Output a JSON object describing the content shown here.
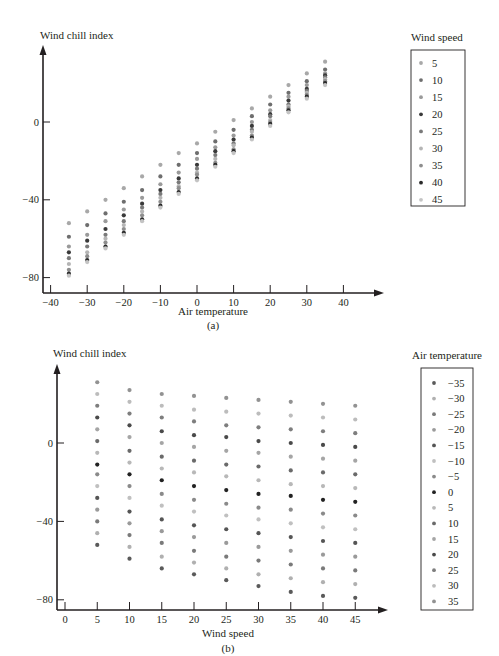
{
  "chart_data": [
    {
      "id": "a",
      "type": "scatter",
      "caption": "(a)",
      "title": "",
      "xlabel": "Air temperature",
      "ylabel": "Wind chill index",
      "xlim": [
        -40,
        40
      ],
      "ylim": [
        -80,
        35
      ],
      "xticks": [
        -40,
        -30,
        -20,
        -10,
        0,
        10,
        20,
        30,
        40
      ],
      "xtick_labels": [
        "−40",
        "−30",
        "−20",
        "−10",
        "0",
        "10",
        "20",
        "30",
        "40"
      ],
      "yticks": [
        0,
        -40,
        -80
      ],
      "ytick_labels": [
        "0",
        "−40",
        "−80"
      ],
      "grid": false,
      "legend_title": "Wind speed",
      "legend_position": "right",
      "x": [
        -35,
        -30,
        -25,
        -20,
        -15,
        -10,
        -5,
        0,
        5,
        10,
        15,
        20,
        25,
        30,
        35
      ],
      "series": [
        {
          "name": "5",
          "color": "#a8a8a8",
          "values": [
            -52,
            -46,
            -40,
            -34,
            -28,
            -22,
            -16,
            -11,
            -5,
            1,
            7,
            13,
            19,
            25,
            31
          ]
        },
        {
          "name": "10",
          "color": "#6e6e6e",
          "values": [
            -59,
            -53,
            -47,
            -41,
            -35,
            -28,
            -22,
            -16,
            -10,
            -4,
            3,
            9,
            15,
            21,
            27
          ]
        },
        {
          "name": "15",
          "color": "#9a9a9a",
          "values": [
            -64,
            -58,
            -51,
            -45,
            -39,
            -32,
            -26,
            -19,
            -13,
            -7,
            0,
            6,
            13,
            19,
            25
          ]
        },
        {
          "name": "20",
          "color": "#3a3a3a",
          "values": [
            -67,
            -61,
            -55,
            -48,
            -42,
            -35,
            -29,
            -22,
            -15,
            -9,
            -2,
            4,
            11,
            17,
            24
          ]
        },
        {
          "name": "25",
          "color": "#7a7a7a",
          "values": [
            -70,
            -64,
            -58,
            -51,
            -44,
            -37,
            -31,
            -24,
            -17,
            -11,
            -4,
            3,
            9,
            16,
            23
          ]
        },
        {
          "name": "30",
          "color": "#b5b5b5",
          "values": [
            -73,
            -67,
            -60,
            -53,
            -46,
            -39,
            -33,
            -26,
            -19,
            -12,
            -5,
            1,
            8,
            15,
            22
          ]
        },
        {
          "name": "35",
          "color": "#8e8e8e",
          "values": [
            -76,
            -69,
            -62,
            -55,
            -48,
            -41,
            -34,
            -27,
            -21,
            -14,
            -7,
            0,
            7,
            14,
            21
          ]
        },
        {
          "name": "40",
          "color": "#2a2a2a",
          "values": [
            -78,
            -71,
            -64,
            -57,
            -50,
            -43,
            -36,
            -29,
            -22,
            -15,
            -8,
            -1,
            6,
            13,
            20
          ]
        },
        {
          "name": "45",
          "color": "#c4c4c4",
          "values": [
            -79,
            -72,
            -65,
            -58,
            -51,
            -44,
            -37,
            -30,
            -23,
            -16,
            -9,
            -2,
            5,
            12,
            19
          ]
        }
      ]
    },
    {
      "id": "b",
      "type": "scatter",
      "caption": "(b)",
      "title": "",
      "xlabel": "Wind speed",
      "ylabel": "Wind chill index",
      "xlim": [
        0,
        45
      ],
      "ylim": [
        -80,
        35
      ],
      "xticks": [
        0,
        5,
        10,
        15,
        20,
        25,
        30,
        35,
        40,
        45
      ],
      "xtick_labels": [
        "0",
        "5",
        "10",
        "15",
        "20",
        "25",
        "30",
        "35",
        "40",
        "45"
      ],
      "yticks": [
        0,
        -40,
        -80
      ],
      "ytick_labels": [
        "0",
        "−40",
        "−80"
      ],
      "grid": false,
      "legend_title": "Air temperature",
      "legend_position": "right",
      "x": [
        5,
        10,
        15,
        20,
        25,
        30,
        35,
        40,
        45
      ],
      "series": [
        {
          "name": "−35",
          "color": "#5a5a5a",
          "values": [
            -52,
            -59,
            -64,
            -67,
            -70,
            -73,
            -76,
            -78,
            -79
          ]
        },
        {
          "name": "−30",
          "color": "#b0b0b0",
          "values": [
            -46,
            -53,
            -58,
            -61,
            -64,
            -67,
            -69,
            -71,
            -72
          ]
        },
        {
          "name": "−25",
          "color": "#7a7a7a",
          "values": [
            -40,
            -47,
            -51,
            -55,
            -58,
            -60,
            -62,
            -64,
            -65
          ]
        },
        {
          "name": "−20",
          "color": "#9a9a9a",
          "values": [
            -34,
            -41,
            -45,
            -48,
            -51,
            -53,
            -55,
            -57,
            -58
          ]
        },
        {
          "name": "−15",
          "color": "#555555",
          "values": [
            -28,
            -35,
            -39,
            -42,
            -44,
            -46,
            -48,
            -50,
            -51
          ]
        },
        {
          "name": "−10",
          "color": "#c0c0c0",
          "values": [
            -22,
            -28,
            -32,
            -35,
            -37,
            -39,
            -41,
            -43,
            -44
          ]
        },
        {
          "name": "−5",
          "color": "#8a8a8a",
          "values": [
            -16,
            -22,
            -26,
            -29,
            -31,
            -33,
            -34,
            -36,
            -37
          ]
        },
        {
          "name": "0",
          "color": "#222222",
          "values": [
            -11,
            -16,
            -19,
            -22,
            -24,
            -26,
            -27,
            -29,
            -30
          ]
        },
        {
          "name": "5",
          "color": "#b8b8b8",
          "values": [
            -5,
            -10,
            -13,
            -15,
            -17,
            -19,
            -21,
            -22,
            -23
          ]
        },
        {
          "name": "10",
          "color": "#6a6a6a",
          "values": [
            1,
            -4,
            -7,
            -9,
            -11,
            -12,
            -14,
            -15,
            -16
          ]
        },
        {
          "name": "15",
          "color": "#a5a5a5",
          "values": [
            7,
            3,
            0,
            -2,
            -4,
            -5,
            -7,
            -8,
            -9
          ]
        },
        {
          "name": "20",
          "color": "#4a4a4a",
          "values": [
            13,
            9,
            6,
            4,
            3,
            1,
            0,
            -1,
            -2
          ]
        },
        {
          "name": "25",
          "color": "#7e7e7e",
          "values": [
            19,
            15,
            13,
            11,
            9,
            8,
            7,
            6,
            5
          ]
        },
        {
          "name": "30",
          "color": "#bcbcbc",
          "values": [
            25,
            21,
            19,
            17,
            16,
            15,
            14,
            13,
            12
          ]
        },
        {
          "name": "35",
          "color": "#929292",
          "values": [
            31,
            27,
            25,
            24,
            23,
            22,
            21,
            20,
            19
          ]
        }
      ]
    }
  ]
}
